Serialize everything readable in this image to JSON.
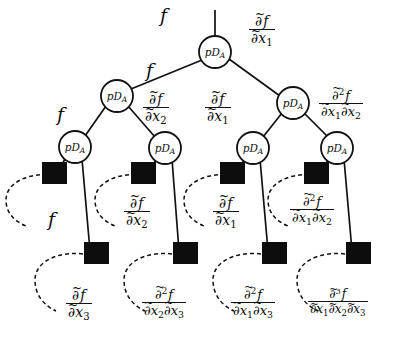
{
  "figure": {
    "node_label_main": "pD",
    "node_label_sub": "A",
    "colors": {
      "stroke": "#111111",
      "leaf_fill": "#0d0d0d",
      "background": "#ffffff",
      "node_fill": "#ffffff"
    }
  },
  "nodes": [
    {
      "id": "n0",
      "label_main": "pD",
      "label_sub": "A",
      "level": 0,
      "cx": 215,
      "cy": 52
    },
    {
      "id": "n1",
      "label_main": "pD",
      "label_sub": "A",
      "level": 1,
      "cx": 117,
      "cy": 96
    },
    {
      "id": "n2",
      "label_main": "pD",
      "label_sub": "A",
      "level": 1,
      "cx": 293,
      "cy": 103
    },
    {
      "id": "n3",
      "label_main": "pD",
      "label_sub": "A",
      "level": 2,
      "cx": 75,
      "cy": 147
    },
    {
      "id": "n4",
      "label_main": "pD",
      "label_sub": "A",
      "level": 2,
      "cx": 165,
      "cy": 148
    },
    {
      "id": "n5",
      "label_main": "pD",
      "label_sub": "A",
      "level": 2,
      "cx": 253,
      "cy": 148
    },
    {
      "id": "n6",
      "label_main": "pD",
      "label_sub": "A",
      "level": 2,
      "cx": 337,
      "cy": 148
    }
  ],
  "leaves": [
    {
      "id": "s1",
      "row": "upper",
      "x": 54,
      "y": 173
    },
    {
      "id": "s2",
      "row": "upper",
      "x": 143,
      "y": 173
    },
    {
      "id": "s3",
      "row": "upper",
      "x": 232,
      "y": 173
    },
    {
      "id": "s4",
      "row": "upper",
      "x": 316,
      "y": 173
    },
    {
      "id": "s5",
      "row": "lower",
      "x": 83,
      "y": 252
    },
    {
      "id": "s6",
      "row": "lower",
      "x": 172,
      "y": 252
    },
    {
      "id": "s7",
      "row": "lower",
      "x": 261,
      "y": 252
    },
    {
      "id": "s8",
      "row": "lower",
      "x": 345,
      "y": 252
    }
  ],
  "edge_labels": {
    "root_in": {
      "text": "f",
      "kind": "function"
    },
    "root_right": {
      "order": 1,
      "num": "∂f",
      "den": "∂x₁",
      "vars": [
        "x1"
      ]
    },
    "n0_left": {
      "text": "f",
      "kind": "function"
    },
    "n1_left": {
      "text": "f",
      "kind": "function"
    },
    "n1_right": {
      "order": 1,
      "num": "∂f",
      "den": "∂x₂",
      "vars": [
        "x2"
      ]
    },
    "n2_left": {
      "order": 1,
      "num": "∂f",
      "den": "∂x₁",
      "vars": [
        "x1"
      ]
    },
    "n2_right": {
      "order": 2,
      "num": "∂²f",
      "den": "∂x₁∂x₂",
      "vars": [
        "x1",
        "x2"
      ]
    },
    "n3_left_leaf": {
      "text": "f",
      "kind": "function"
    },
    "n4_left_leaf": {
      "order": 1,
      "num": "∂f",
      "den": "∂x₂",
      "vars": [
        "x2"
      ]
    },
    "n5_left_leaf": {
      "order": 1,
      "num": "∂f",
      "den": "∂x₁",
      "vars": [
        "x1"
      ]
    },
    "n6_left_leaf": {
      "order": 2,
      "num": "∂²f",
      "den": "∂x₁∂x₂",
      "vars": [
        "x1",
        "x2"
      ]
    },
    "leaf5": {
      "order": 1,
      "num": "∂f",
      "den": "∂x₃",
      "vars": [
        "x3"
      ]
    },
    "leaf6": {
      "order": 2,
      "num": "∂²f",
      "den": "∂x₂∂x₃",
      "vars": [
        "x2",
        "x3"
      ]
    },
    "leaf7": {
      "order": 2,
      "num": "∂²f",
      "den": "∂x₁∂x₃",
      "vars": [
        "x1",
        "x3"
      ]
    },
    "leaf8": {
      "order": 3,
      "num": "∂³f",
      "den": "∂x₁∂x₂∂x₃",
      "vars": [
        "x1",
        "x2",
        "x3"
      ]
    }
  },
  "symbols": {
    "f": "f",
    "partial": "∂",
    "tilde": "~",
    "x": "x",
    "one": "1",
    "two": "2",
    "three": "3",
    "sup2": "2",
    "sup3": "3"
  }
}
